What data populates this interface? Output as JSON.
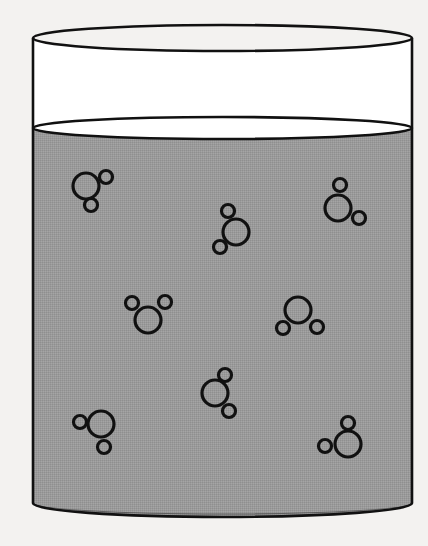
{
  "figure": {
    "caption": "",
    "width": 428,
    "height": 546,
    "background_color": "#f3f2f0",
    "line_color": "#111111"
  },
  "beaker": {
    "label": "beaker",
    "left_wall_x": 33,
    "right_wall_x": 412,
    "rim_top_y": 25,
    "rim_side_y": 38,
    "rim_bottom_y": 51,
    "base_side_y": 503,
    "base_front_y": 517,
    "base_back_y": 492,
    "fill_color": "#ffffff",
    "stroke_color": "#111111",
    "stroke_width": 2.6
  },
  "water": {
    "label": "water body",
    "surface_top_y": 117,
    "surface_side_y": 128,
    "surface_bottom_y": 145,
    "fill_color": "#9a9a9a",
    "stroke_color": "#111111",
    "stroke_width": 2.6,
    "state": "liquid"
  },
  "molecule_style": {
    "oxygen_radius": 13,
    "hydrogen_radius": 6.5,
    "stroke_color": "#111111",
    "stroke_width": 3.2,
    "fill": "none"
  },
  "molecules": [
    {
      "id": "molecule-1",
      "label": "water molecule 1",
      "oxygen": {
        "cx": 86,
        "cy": 186
      },
      "hydrogens": [
        {
          "cx": 106,
          "cy": 177
        },
        {
          "cx": 91,
          "cy": 205
        }
      ]
    },
    {
      "id": "molecule-2",
      "label": "water molecule 2",
      "oxygen": {
        "cx": 236,
        "cy": 232
      },
      "hydrogens": [
        {
          "cx": 228,
          "cy": 211
        },
        {
          "cx": 220,
          "cy": 247
        }
      ]
    },
    {
      "id": "molecule-3",
      "label": "water molecule 3",
      "oxygen": {
        "cx": 338,
        "cy": 208
      },
      "hydrogens": [
        {
          "cx": 340,
          "cy": 185
        },
        {
          "cx": 359,
          "cy": 218
        }
      ]
    },
    {
      "id": "molecule-4",
      "label": "water molecule 4",
      "oxygen": {
        "cx": 148,
        "cy": 320
      },
      "hydrogens": [
        {
          "cx": 132,
          "cy": 303
        },
        {
          "cx": 165,
          "cy": 302
        }
      ]
    },
    {
      "id": "molecule-5",
      "label": "water molecule 5",
      "oxygen": {
        "cx": 298,
        "cy": 310
      },
      "hydrogens": [
        {
          "cx": 283,
          "cy": 328
        },
        {
          "cx": 317,
          "cy": 327
        }
      ]
    },
    {
      "id": "molecule-6",
      "label": "water molecule 6",
      "oxygen": {
        "cx": 215,
        "cy": 393
      },
      "hydrogens": [
        {
          "cx": 225,
          "cy": 375
        },
        {
          "cx": 229,
          "cy": 411
        }
      ]
    },
    {
      "id": "molecule-7",
      "label": "water molecule 7",
      "oxygen": {
        "cx": 101,
        "cy": 424
      },
      "hydrogens": [
        {
          "cx": 80,
          "cy": 422
        },
        {
          "cx": 104,
          "cy": 447
        }
      ]
    },
    {
      "id": "molecule-8",
      "label": "water molecule 8",
      "oxygen": {
        "cx": 348,
        "cy": 444
      },
      "hydrogens": [
        {
          "cx": 348,
          "cy": 423
        },
        {
          "cx": 325,
          "cy": 446
        }
      ]
    }
  ]
}
